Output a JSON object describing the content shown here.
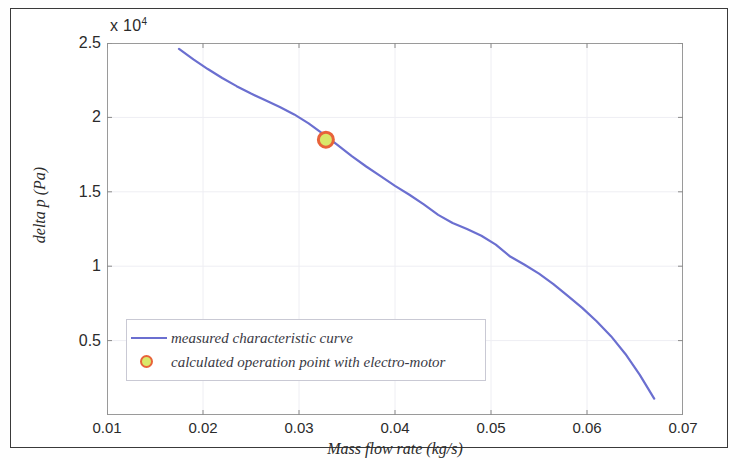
{
  "figure": {
    "background_color": "#ffffff",
    "frame_color": "#3a3a3a"
  },
  "axes": {
    "exponent_label": "x 10",
    "exponent_power": "4",
    "x_label": "Mass flow rate (kg/s)",
    "y_label": "delta p (Pa)",
    "x_ticks": [
      "0.01",
      "0.02",
      "0.03",
      "0.04",
      "0.05",
      "0.06",
      "0.07"
    ],
    "y_ticks": [
      "0.5",
      "1",
      "1.5",
      "2",
      "2.5"
    ]
  },
  "legend": {
    "items": [
      {
        "label": "measured characteristic curve",
        "marker": "line",
        "color": "#6b6fd0"
      },
      {
        "label": "calculated operation point with electro-motor",
        "marker": "circle",
        "color": "#e8633a",
        "fill": "#d9e86a"
      }
    ]
  },
  "chart_data": {
    "type": "line",
    "title": "",
    "xlabel": "Mass flow rate (kg/s)",
    "ylabel": "delta p (Pa)",
    "xlim": [
      0.01,
      0.07
    ],
    "ylim": [
      0,
      25000
    ],
    "y_exponent": 10000,
    "grid": true,
    "legend_position": "lower-left-inside",
    "series": [
      {
        "name": "measured characteristic curve",
        "type": "line",
        "color": "#6b6fd0",
        "x": [
          0.0175,
          0.019,
          0.0205,
          0.022,
          0.0235,
          0.025,
          0.0265,
          0.028,
          0.0295,
          0.031,
          0.0325,
          0.034,
          0.0355,
          0.037,
          0.0385,
          0.04,
          0.0415,
          0.043,
          0.0445,
          0.046,
          0.0475,
          0.049,
          0.0505,
          0.052,
          0.0535,
          0.055,
          0.0565,
          0.058,
          0.0595,
          0.061,
          0.0625,
          0.064,
          0.0655,
          0.067
        ],
        "y": [
          24600,
          23900,
          23250,
          22650,
          22100,
          21600,
          21150,
          20700,
          20200,
          19600,
          18900,
          18150,
          17400,
          16700,
          16050,
          15400,
          14800,
          14150,
          13450,
          12900,
          12500,
          12050,
          11450,
          10650,
          10100,
          9500,
          8800,
          8000,
          7200,
          6300,
          5300,
          4100,
          2700,
          1100
        ]
      },
      {
        "name": "calculated operation point with electro-motor",
        "type": "scatter",
        "color": "#e8633a",
        "fill": "#d9e86a",
        "x": [
          0.0328
        ],
        "y": [
          18500
        ]
      }
    ]
  }
}
